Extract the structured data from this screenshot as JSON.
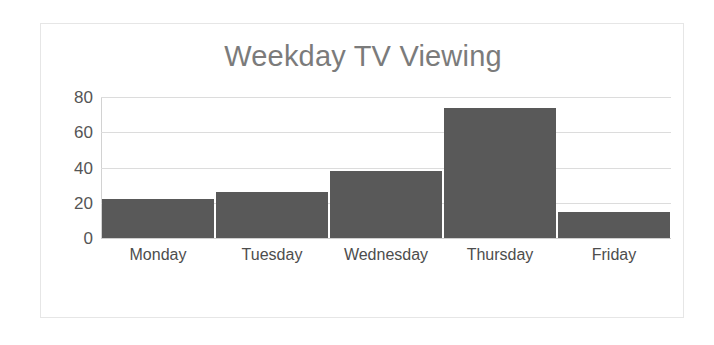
{
  "chart_data": {
    "type": "bar",
    "title": "Weekday TV Viewing",
    "xlabel": "",
    "ylabel": "",
    "categories": [
      "Monday",
      "Tuesday",
      "Wednesday",
      "Thursday",
      "Friday"
    ],
    "values": [
      22,
      26,
      38,
      74,
      15
    ],
    "ylim": [
      0,
      80
    ],
    "yticks": [
      0,
      20,
      40,
      60,
      80
    ],
    "ytick_labels": [
      "0",
      "20",
      "40",
      "60",
      "80"
    ],
    "grid": true,
    "legend": false,
    "legend_position": "none",
    "series": [
      {
        "name": "Weekday TV Viewing",
        "values": [
          22,
          26,
          38,
          74,
          15
        ],
        "color": "#595959"
      }
    ],
    "colors": {
      "bar": "#595959",
      "title": "#7b7b7b",
      "tick_label": "#555555",
      "category_label": "#4d4d4d",
      "gridline": "#dcdcdc",
      "axis_line": "#d2d2d2",
      "frame_border": "#e6e6e6",
      "background": "#ffffff"
    }
  }
}
